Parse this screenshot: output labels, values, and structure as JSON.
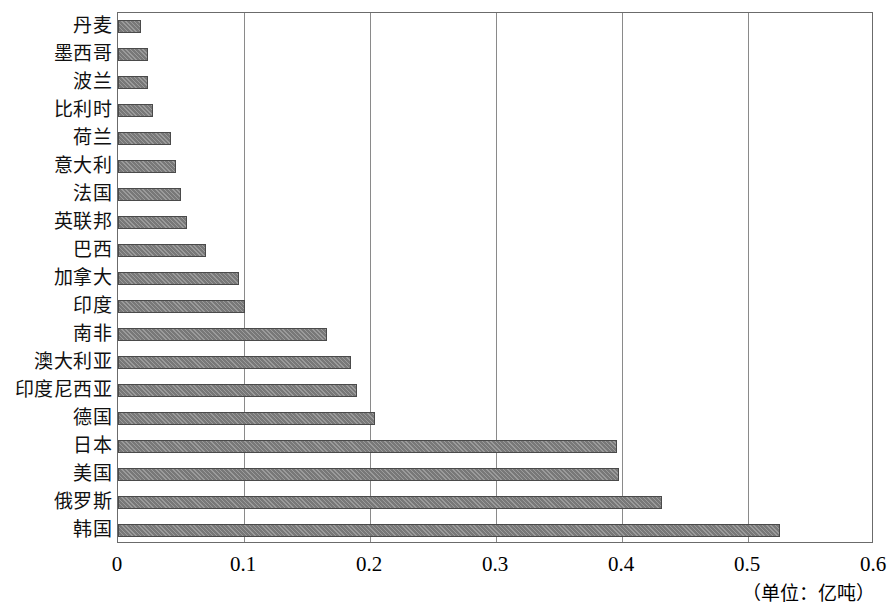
{
  "chart_data": {
    "type": "bar",
    "orientation": "horizontal",
    "title": "",
    "xlabel": "",
    "ylabel": "",
    "unit_note": "（单位：亿吨）",
    "xlim": [
      0,
      0.6
    ],
    "xticks": [
      "0",
      "0.1",
      "0.2",
      "0.3",
      "0.4",
      "0.5",
      "0.6"
    ],
    "xtick_values": [
      0,
      0.1,
      0.2,
      0.3,
      0.4,
      0.5,
      0.6
    ],
    "grid": true,
    "legend": "none",
    "bar_color": "#7f7f7f",
    "bar_edge_color": "#4a4a4a",
    "grid_color": "#8a8a8a",
    "categories": [
      "丹麦",
      "墨西哥",
      "波兰",
      "比利时",
      "荷兰",
      "意大利",
      "法国",
      "英联邦",
      "巴西",
      "加拿大",
      "印度",
      "南非",
      "澳大利亚",
      "印度尼西亚",
      "德国",
      "日本",
      "美国",
      "俄罗斯",
      "韩国"
    ],
    "values": [
      0.018,
      0.024,
      0.024,
      0.028,
      0.042,
      0.046,
      0.05,
      0.055,
      0.07,
      0.096,
      0.101,
      0.166,
      0.185,
      0.19,
      0.204,
      0.396,
      0.398,
      0.432,
      0.525
    ]
  }
}
